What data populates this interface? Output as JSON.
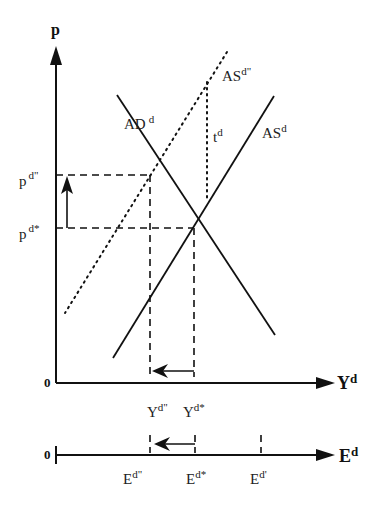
{
  "diagram": {
    "colors": {
      "ink": "#111111",
      "background": "#ffffff"
    },
    "upper_panel": {
      "y_axis": {
        "label": "p"
      },
      "x_axis": {
        "label": "Y",
        "label_sup": "d"
      },
      "origin_label": "0",
      "curves": [
        {
          "id": "ad",
          "label": "AD",
          "label_sup": "d",
          "style": "solid",
          "slope": "downward"
        },
        {
          "id": "as",
          "label": "AS",
          "label_sup": "d",
          "style": "solid",
          "slope": "upward"
        },
        {
          "id": "as2",
          "label": "AS",
          "label_sup": "d\"",
          "style": "dotted",
          "slope": "upward"
        },
        {
          "id": "tax",
          "label": "t",
          "label_sup": "d",
          "style": "dotted-vertical"
        }
      ],
      "price_levels": [
        {
          "id": "p_new",
          "label": "p",
          "label_sup": "d\""
        },
        {
          "id": "p_star",
          "label": "p",
          "label_sup": "d*"
        }
      ],
      "output_levels": [
        {
          "id": "y_new",
          "label": "Y",
          "label_sup": "d\""
        },
        {
          "id": "y_star",
          "label": "Y",
          "label_sup": "d*"
        }
      ],
      "shift_arrows": [
        {
          "id": "price-rise",
          "direction": "up",
          "from": "p_star",
          "to": "p_new"
        },
        {
          "id": "output-fall",
          "direction": "left",
          "from": "y_star",
          "to": "y_new"
        }
      ]
    },
    "lower_panel": {
      "axis": {
        "label": "E",
        "label_sup": "d"
      },
      "origin_label": "0",
      "levels": [
        {
          "id": "e_new",
          "label": "E",
          "label_sup": "d\""
        },
        {
          "id": "e_star",
          "label": "E",
          "label_sup": "d*"
        },
        {
          "id": "e_prime",
          "label": "E",
          "label_sup": "d'"
        }
      ],
      "shift_arrows": [
        {
          "id": "employment-fall",
          "direction": "left",
          "from": "e_star",
          "to": "e_new"
        }
      ]
    }
  }
}
